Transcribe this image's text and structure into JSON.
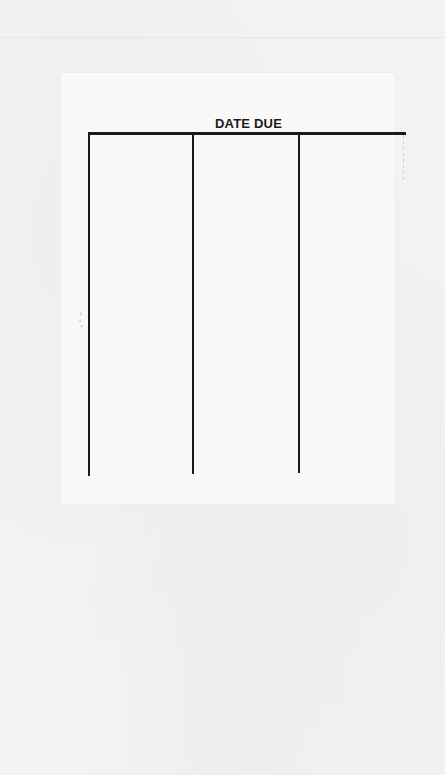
{
  "document": {
    "title": "DATE DUE",
    "columns": 3,
    "entries": [],
    "colors": {
      "ink": "#1b1b1b",
      "paper": "#f3f3f2",
      "slip": "#f9f9f8"
    }
  }
}
